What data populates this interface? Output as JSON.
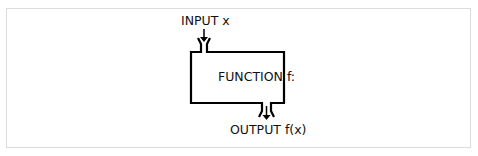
{
  "diagram": {
    "input_label": "INPUT x",
    "function_label": "FUNCTION f:",
    "output_label": "OUTPUT f(x)",
    "stroke_color": "#000000",
    "frame_color": "#dcdcdc"
  }
}
